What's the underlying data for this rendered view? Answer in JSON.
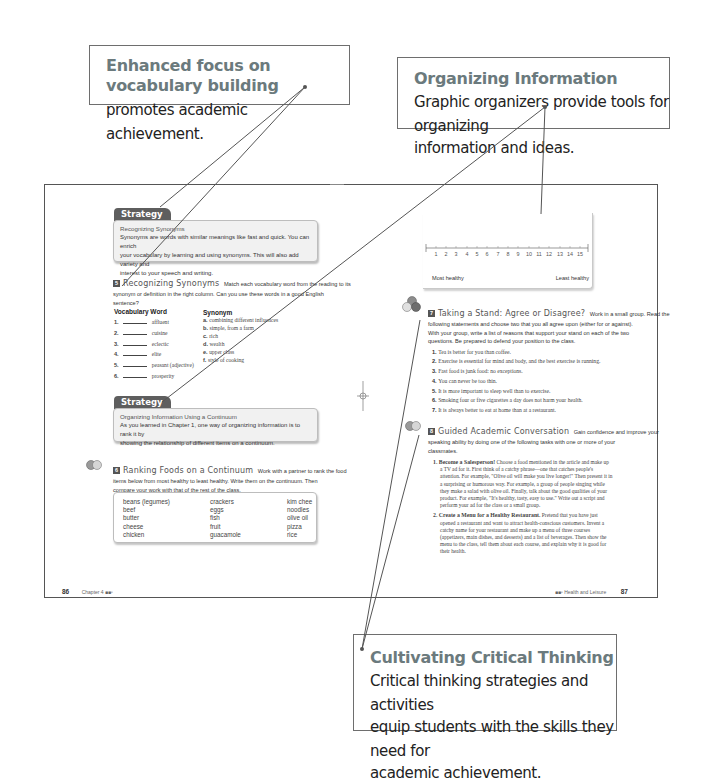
{
  "callouts": {
    "vocabulary": {
      "title": "Enhanced focus on vocabulary building",
      "body": "promotes academic achievement."
    },
    "organizing": {
      "title": "Organizing Information",
      "body_line1": "Graphic organizers provide tools for organizing",
      "body_line2": "information and ideas."
    },
    "critical": {
      "title": "Cultivating Critical Thinking",
      "body_line1": "Critical thinking strategies and activities",
      "body_line2": "equip students with the skills they need for",
      "body_line3": "academic achievement."
    }
  },
  "left_page": {
    "strategy1": {
      "tab": "Strategy",
      "heading": "Recognizing Synonyms",
      "line1": "Synonyms are words with similar meanings like fast and quick. You can enrich",
      "line2": "your vocabulary by learning and using synonyms. This will also add variety and",
      "line3": "interest to your speech and writing."
    },
    "exercise5": {
      "number": "5",
      "title": "Recognizing Synonyms",
      "instr1": "Match each vocabulary word from the reading to its",
      "instr2": "synonym or definition in the right column. Can you use these words in a good English",
      "instr3": "sentence?",
      "col_vocab": "Vocabulary Word",
      "col_synonym": "Synonym",
      "vocab": [
        {
          "num": "1.",
          "word": "affluent"
        },
        {
          "num": "2.",
          "word": "cuisine"
        },
        {
          "num": "3.",
          "word": "eclectic"
        },
        {
          "num": "4.",
          "word": "elite"
        },
        {
          "num": "5.",
          "word": "peasant (adjective)"
        },
        {
          "num": "6.",
          "word": "prosperity"
        }
      ],
      "synonyms": [
        {
          "letter": "a.",
          "text": "combining different influences"
        },
        {
          "letter": "b.",
          "text": "simple, from a farm"
        },
        {
          "letter": "c.",
          "text": "rich"
        },
        {
          "letter": "d.",
          "text": "wealth"
        },
        {
          "letter": "e.",
          "text": "upper class"
        },
        {
          "letter": "f.",
          "text": "style of cooking"
        }
      ]
    },
    "strategy2": {
      "tab": "Strategy",
      "heading": "Organizing Information Using a Continuum",
      "line1": "As you learned in Chapter 1, one way of organizing information is to rank it by",
      "line2": "showing the relationship of different items on a continuum."
    },
    "exercise6": {
      "number": "6",
      "title": "Ranking Foods on a Continuum",
      "instr1": "Work with a partner to rank the food",
      "instr2": "items below from most healthy to least healthy. Write them on the continuum. Then",
      "instr3": "compare your work with that of the rest of the class.",
      "foods_col1": [
        "beans (legumes)",
        "beef",
        "butter",
        "cheese",
        "chicken"
      ],
      "foods_col2": [
        "crackers",
        "eggs",
        "fish",
        "fruit",
        "guacamole"
      ],
      "foods_col3": [
        "kim chee",
        "noodles",
        "olive oil",
        "pizza",
        "rice"
      ]
    },
    "footer": {
      "page": "86",
      "chapter": "Chapter 4 ■■▫"
    }
  },
  "right_page": {
    "continuum": {
      "ticks": [
        "1",
        "2",
        "3",
        "4",
        "5",
        "6",
        "7",
        "8",
        "9",
        "10",
        "11",
        "12",
        "13",
        "14",
        "15"
      ],
      "left_label": "Most healthy",
      "right_label": "Least healthy"
    },
    "exercise7": {
      "number": "7",
      "title": "Taking a Stand: Agree or Disagree?",
      "instr1": "Work in a small group. Read the",
      "instr2": "following statements and choose two that you all agree upon (either for or against).",
      "instr3": "With your group, write a list of reasons that support your stand on each of the two",
      "instr4": "questions. Be prepared to defend your position to the class.",
      "statements": [
        {
          "num": "1.",
          "text": "Tea is better for you than coffee."
        },
        {
          "num": "2.",
          "text": "Exercise is essential for mind and body, and the best exercise is running."
        },
        {
          "num": "3.",
          "text": "Fast food is junk food: no exceptions."
        },
        {
          "num": "4.",
          "text": "You can never be too thin."
        },
        {
          "num": "5.",
          "text": "It is more important to sleep well than to exercise."
        },
        {
          "num": "6.",
          "text": "Smoking four or five cigarettes a day does not harm your health."
        },
        {
          "num": "7.",
          "text": "It is always better to eat at home than at a restaurant."
        }
      ]
    },
    "exercise8": {
      "number": "8",
      "title": "Guided Academic Conversation",
      "instr1": "Gain confidence and improve your",
      "instr2": "speaking ability by doing one of the following tasks with one or more of your",
      "instr3": "classmates.",
      "task1_title": "Become a Salesperson!",
      "task1_lines": [
        "Choose a food mentioned in the article and make up",
        "a TV ad for it. First think of a catchy phrase—one that catches people's",
        "attention. For example, \"Olive oil will make you live longer!\" Then present it in",
        "a surprising or humorous way. For example, a group of people singing while",
        "they make a salad with olive oil. Finally, talk about the good qualities of your",
        "product. For example, \"It's healthy, tasty, easy to use.\" Write out a script and",
        "perform your ad for the class or a small group."
      ],
      "task2_title": "Create a Menu for a Healthy Restaurant.",
      "task2_lines": [
        "Pretend that you have just",
        "opened a restaurant and want to attract health-conscious customers. Invent a",
        "catchy name for your restaurant and make up a menu of three courses",
        "(appetizers, main dishes, and desserts) and a list of beverages. Then show the",
        "menu to the class, tell them about each course, and explain why it is good for",
        "their health."
      ]
    },
    "footer": {
      "section": "■■▫ Health and Leisure",
      "page": "87"
    }
  },
  "colors": {
    "callout_title": "#6b7a7d",
    "strategy_tab": "#5e5e5e",
    "strategy_bg": "#f1f1f1",
    "frame": "#555555"
  }
}
